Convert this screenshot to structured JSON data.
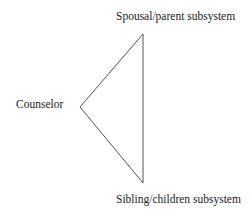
{
  "diagram": {
    "type": "triangle",
    "nodes": [
      {
        "id": "spousal",
        "label": "Spousal/parent subsystem",
        "position": "top"
      },
      {
        "id": "counselor",
        "label": "Counselor",
        "position": "left"
      },
      {
        "id": "sibling",
        "label": "Sibling/children subsystem",
        "position": "bottom"
      }
    ],
    "edges": [
      {
        "from": "counselor",
        "to": "spousal"
      },
      {
        "from": "spousal",
        "to": "sibling"
      },
      {
        "from": "sibling",
        "to": "counselor"
      }
    ],
    "line_color": "#555555"
  }
}
